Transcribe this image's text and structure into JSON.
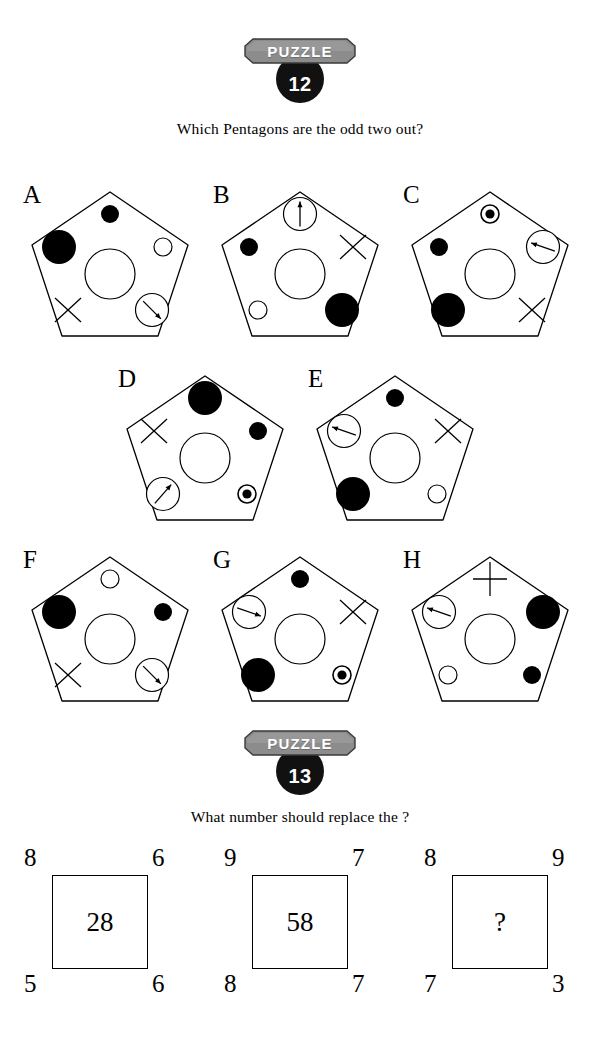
{
  "page": {
    "background": "#ffffff",
    "ink": "#000000",
    "badge_gray": "#8c8c8c"
  },
  "puzzle12": {
    "badge_word": "PUZZLE",
    "number": "12",
    "question": "Which Pentagons are the odd two out?",
    "pentagons": [
      {
        "letter": "A",
        "items": {
          "top": "small-black-circle",
          "upper_left": "large-black-circle",
          "upper_right": "small-white-circle",
          "center": "large-white-circle",
          "lower_left": "x-mark",
          "lower_right": "arrow-circle-down-right"
        }
      },
      {
        "letter": "B",
        "items": {
          "top": "arrow-circle-up",
          "upper_left": "small-black-circle",
          "upper_right": "x-mark",
          "center": "large-white-circle",
          "lower_left": "small-white-circle",
          "lower_right": "large-black-circle"
        }
      },
      {
        "letter": "C",
        "items": {
          "top": "target-circle",
          "upper_left": "small-black-circle",
          "upper_right": "arrow-circle-left",
          "center": "large-white-circle",
          "lower_left": "large-black-circle",
          "lower_right": "x-mark"
        }
      },
      {
        "letter": "D",
        "items": {
          "top": "large-black-circle",
          "upper_left": "x-mark",
          "upper_right": "small-black-circle",
          "center": "large-white-circle",
          "lower_left": "arrow-circle-up-right",
          "lower_right": "target-circle"
        }
      },
      {
        "letter": "E",
        "items": {
          "top": "small-black-circle",
          "upper_left": "arrow-circle-left",
          "upper_right": "x-mark",
          "center": "large-white-circle",
          "lower_left": "large-black-circle",
          "lower_right": "small-white-circle"
        }
      },
      {
        "letter": "F",
        "items": {
          "top": "small-white-circle",
          "upper_left": "large-black-circle",
          "upper_right": "small-black-circle",
          "center": "large-white-circle",
          "lower_left": "x-mark",
          "lower_right": "arrow-circle-down-right"
        }
      },
      {
        "letter": "G",
        "items": {
          "top": "small-black-circle",
          "upper_left": "arrow-circle-right",
          "upper_right": "x-mark",
          "center": "large-white-circle",
          "lower_left": "large-black-circle",
          "lower_right": "target-circle"
        }
      },
      {
        "letter": "H",
        "items": {
          "top": "plus-mark",
          "upper_left": "arrow-circle-left",
          "upper_right": "large-black-circle",
          "center": "large-white-circle",
          "lower_left": "small-white-circle",
          "lower_right": "small-black-circle"
        }
      }
    ]
  },
  "puzzle13": {
    "badge_word": "PUZZLE",
    "number": "13",
    "question": "What number should replace the ?",
    "squares": [
      {
        "top_left": "8",
        "top_right": "6",
        "bottom_left": "5",
        "bottom_right": "6",
        "center": "28"
      },
      {
        "top_left": "9",
        "top_right": "7",
        "bottom_left": "8",
        "bottom_right": "7",
        "center": "58"
      },
      {
        "top_left": "8",
        "top_right": "9",
        "bottom_left": "7",
        "bottom_right": "3",
        "center": "?"
      }
    ]
  }
}
